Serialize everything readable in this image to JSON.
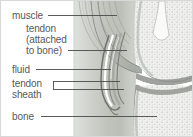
{
  "figure": {
    "type": "medical-illustration",
    "background_color": "#ffffff",
    "border_color": "#d8d8d8",
    "label_color": "#55595c",
    "leader_line_color": "#4a4a4a"
  },
  "labels": {
    "muscle": "muscle",
    "tendon_line1": "tendon",
    "tendon_line2": "(attached",
    "tendon_line3": "to bone)",
    "fluid": "fluid",
    "sheath_line1": "tendon",
    "sheath_line2": "sheath",
    "bone": "bone"
  },
  "structures": [
    {
      "name": "muscle",
      "shading": "#b9bdb6"
    },
    {
      "name": "tendon",
      "shading": "#c9ccc6"
    },
    {
      "name": "fluid",
      "shading": "#ffffff"
    },
    {
      "name": "tendon-sheath",
      "shading": "#9ea39c"
    },
    {
      "name": "bone",
      "shading": "#e9eae6"
    },
    {
      "name": "joint-cartilage",
      "shading": "#8e918b"
    }
  ]
}
